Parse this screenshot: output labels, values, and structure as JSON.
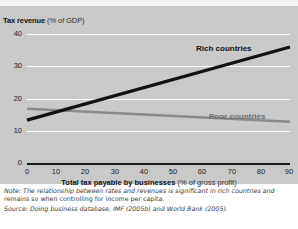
{
  "figure": {
    "y_axis_title_bold": "Tax revenue",
    "y_axis_title_rest": "(% of GDP)",
    "x_axis_title_bold": "Total tax payable by businesses",
    "x_axis_title_rest": "(% of gross profit)",
    "note_label": "Note:",
    "note_text": "The relationship between rates and revenues is significant in rich countries and remains so when controlling for income per capita.",
    "note_line1": "Note: The relationship between rates and revenues is significant in rich countries and",
    "note_line2": "remains so when controlling for income per capita.",
    "source_label": "Source:",
    "source_text": "Doing business database, IMF (2005b) and World Bank (2005).",
    "source_line": "Source: Doing business database, IMF (2005b) and World Bank (2005)."
  },
  "colors": {
    "panel_background": "#c9c9c9",
    "gridline": "#ffffff",
    "axis": "#1a1a1a",
    "rich_line": "#111111",
    "poor_line": "#8a8a8a",
    "page_background": "#ffffff"
  },
  "chart_data": {
    "type": "line",
    "title": "",
    "xlabel": "Total tax payable by businesses (% of gross profit)",
    "ylabel": "Tax revenue (% of GDP)",
    "xlim": [
      0,
      90
    ],
    "ylim": [
      0,
      40
    ],
    "xticks": [
      0,
      10,
      20,
      30,
      40,
      50,
      60,
      70,
      80,
      90
    ],
    "yticks": [
      0,
      10,
      20,
      30,
      40
    ],
    "grid": "horizontal",
    "legend": "inline-labels",
    "series": [
      {
        "name": "Rich countries",
        "color": "#111111",
        "x": [
          0,
          90
        ],
        "values": [
          13.5,
          36.0
        ],
        "label_position": "upper-right"
      },
      {
        "name": "Poor countries",
        "color": "#8a8a8a",
        "x": [
          0,
          90
        ],
        "values": [
          17.0,
          13.0
        ],
        "label_position": "right"
      }
    ],
    "annotations": [
      "Lines cross at approximately x = 20, y = 16"
    ]
  }
}
